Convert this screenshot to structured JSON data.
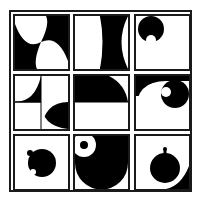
{
  "puzzle": {
    "type": "3x3 visual pattern matrix",
    "colors": {
      "ink": "#000000",
      "paper": "#ffffff",
      "border": "#1a1a1a"
    },
    "cells": [
      {
        "row": 1,
        "col": 1,
        "description": "pinwheel of black quarter-circle wedges in opposite corners"
      },
      {
        "row": 1,
        "col": 2,
        "description": "two vertical black concave arcs forming hourglass columns"
      },
      {
        "row": 1,
        "col": 3,
        "description": "black circle top-left with small white circle notch at bottom"
      },
      {
        "row": 2,
        "col": 1,
        "description": "black quarter-arc shapes split by horizontal line"
      },
      {
        "row": 2,
        "col": 2,
        "description": "black top half with white quarter-circle cut at top-right"
      },
      {
        "row": 2,
        "col": 3,
        "description": "black corner with white rounded shape and small white dot in black circle"
      },
      {
        "row": 3,
        "col": 1,
        "description": "black circle with small black bump and white notch"
      },
      {
        "row": 3,
        "col": 2,
        "description": "large black semicircle with white ring containing black dot"
      },
      {
        "row": 3,
        "col": 3,
        "description": "black circle with stem on top, black crescent at bottom-right"
      }
    ]
  }
}
